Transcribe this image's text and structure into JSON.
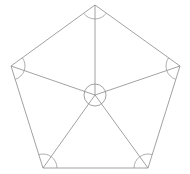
{
  "figure": {
    "type": "geometric-diagram",
    "canvas": {
      "width": 190,
      "height": 174,
      "background": "#ffffff"
    },
    "stroke": {
      "color": "#8a8a8a",
      "width": 0.8
    },
    "polygon": {
      "name": "regular-pentagon",
      "sides": 5,
      "interior_angle_degrees": 108,
      "central_angle_degrees": 72,
      "vertices": [
        {
          "label": "top",
          "x": 95,
          "y": 5
        },
        {
          "label": "right",
          "x": 180,
          "y": 66
        },
        {
          "label": "bottom-right",
          "x": 148,
          "y": 168
        },
        {
          "label": "bottom-left",
          "x": 43,
          "y": 168
        },
        {
          "label": "left",
          "x": 11,
          "y": 66
        }
      ]
    },
    "center": {
      "x": 95,
      "y": 95,
      "circle_radius": 11
    },
    "radii": [
      {
        "from": "center",
        "to": "top"
      },
      {
        "from": "center",
        "to": "right"
      },
      {
        "from": "center",
        "to": "bottom-right"
      },
      {
        "from": "center",
        "to": "bottom-left"
      },
      {
        "from": "center",
        "to": "left"
      }
    ],
    "angle_arcs": [
      {
        "at_vertex": "top",
        "radius": 14,
        "angle_degrees": 108
      },
      {
        "at_vertex": "right",
        "radius": 14,
        "angle_degrees": 108
      },
      {
        "at_vertex": "bottom-right",
        "radius": 14,
        "angle_degrees": 108
      },
      {
        "at_vertex": "bottom-left",
        "radius": 14,
        "angle_degrees": 108
      },
      {
        "at_vertex": "left",
        "radius": 14,
        "angle_degrees": 108
      }
    ]
  }
}
